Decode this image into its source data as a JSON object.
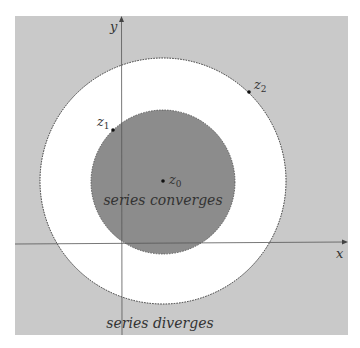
{
  "diagram": {
    "colors": {
      "page": "#ffffff",
      "outer_region": "#c8c8c8",
      "annulus": "#ffffff",
      "disk": "#8a8a8a",
      "axis": "#555555",
      "boundary": "#333333"
    },
    "axes": {
      "x_label": "x",
      "y_label": "y"
    },
    "points": {
      "z0": {
        "name": "z",
        "sub": "0"
      },
      "z1": {
        "name": "z",
        "sub": "1"
      },
      "z2": {
        "name": "z",
        "sub": "2"
      }
    },
    "regions": {
      "inner": "series converges",
      "outer": "series diverges"
    }
  }
}
